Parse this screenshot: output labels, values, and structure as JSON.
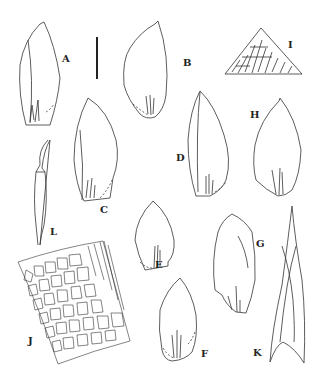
{
  "figure": {
    "type": "botanical-plate",
    "panels": [
      {
        "id": "A",
        "label": "A",
        "description": "leaf"
      },
      {
        "id": "B",
        "label": "B",
        "description": "leaf"
      },
      {
        "id": "C",
        "label": "C",
        "description": "leaf"
      },
      {
        "id": "D",
        "label": "D",
        "description": "leaf"
      },
      {
        "id": "E",
        "label": "E",
        "description": "leaf"
      },
      {
        "id": "F",
        "label": "F",
        "description": "leaf"
      },
      {
        "id": "G",
        "label": "G",
        "description": "leaf"
      },
      {
        "id": "H",
        "label": "H",
        "description": "leaf"
      },
      {
        "id": "I",
        "label": "I",
        "description": "leaf apex cells"
      },
      {
        "id": "J",
        "label": "J",
        "description": "basal leaf cells"
      },
      {
        "id": "K",
        "label": "K",
        "description": "perichaetial leaf"
      },
      {
        "id": "L",
        "label": "L",
        "description": "calyptra"
      }
    ],
    "scale_bar": "vertical bar"
  }
}
